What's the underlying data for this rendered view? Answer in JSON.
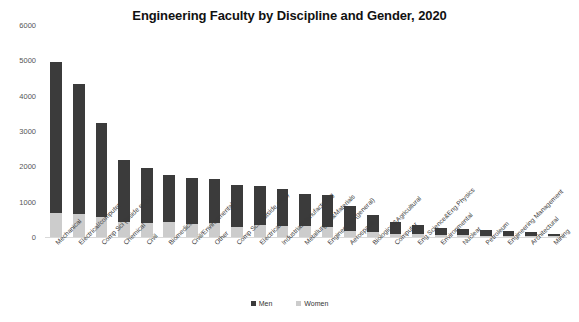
{
  "chart_data": {
    "type": "bar",
    "subtype": "stacked-column",
    "title": "Engineering Faculty by Discipline and Gender, 2020",
    "xlabel": "",
    "ylabel": "",
    "ylim": [
      0,
      6000
    ],
    "yticks": [
      0,
      1000,
      2000,
      3000,
      4000,
      5000,
      6000
    ],
    "grid": false,
    "legend_position": "bottom",
    "categories": [
      "Mechanical",
      "Electrical/computer",
      "Comp Sci (inside eng.)",
      "Chemical",
      "Civil",
      "Biomedical",
      "Civil/Environmental",
      "Other",
      "Comp Sci (outside eng.)",
      "Electrical",
      "Industrial/Manufacturing",
      "Metallurgical&Materials",
      "Engineering (general)",
      "Aerospace",
      "Biological&Agricultural",
      "Computer",
      "Eng.Science&Eng.Physics",
      "Environmental",
      "Nuclear",
      "Petroleum",
      "Engineering Management",
      "Architectural",
      "Mining"
    ],
    "series": [
      {
        "name": "Men",
        "color": "#3b3b3b",
        "values": [
          4270,
          3700,
          2640,
          1760,
          1530,
          1340,
          1300,
          1230,
          1180,
          1110,
          1030,
          930,
          900,
          710,
          480,
          330,
          265,
          205,
          195,
          165,
          130,
          105,
          75
        ]
      },
      {
        "name": "Women",
        "color": "#cccccc",
        "values": [
          680,
          640,
          580,
          430,
          410,
          420,
          370,
          400,
          290,
          330,
          320,
          300,
          290,
          180,
          130,
          90,
          75,
          55,
          45,
          35,
          40,
          25,
          15
        ]
      }
    ],
    "totals": [
      4950,
      4340,
      3220,
      2190,
      1940,
      1760,
      1670,
      1630,
      1470,
      1440,
      1350,
      1230,
      1190,
      890,
      610,
      420,
      340,
      260,
      240,
      200,
      170,
      130,
      90
    ]
  },
  "legend": {
    "items": [
      {
        "label": "Men",
        "color": "#3b3b3b"
      },
      {
        "label": "Women",
        "color": "#cccccc"
      }
    ]
  }
}
